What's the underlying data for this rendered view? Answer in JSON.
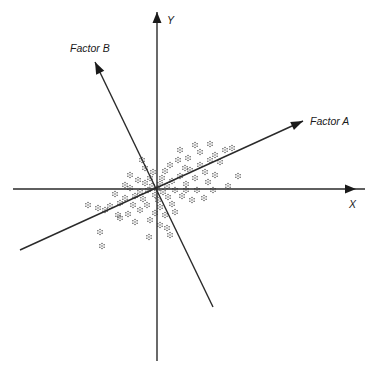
{
  "diagram": {
    "title": "",
    "axes": {
      "x": {
        "label": "X",
        "start": [
          13,
          189
        ],
        "end": [
          365,
          189
        ],
        "arrow_tip": [
          356,
          189
        ],
        "label_pos": [
          349,
          199
        ]
      },
      "y": {
        "label": "Y",
        "start": [
          157,
          361
        ],
        "end": [
          157,
          12
        ],
        "arrow_tip": [
          157,
          12
        ],
        "label_pos": [
          167,
          15
        ]
      }
    },
    "factors": [
      {
        "name": "Factor A",
        "label": "Factor A",
        "start": [
          20,
          250
        ],
        "tip": [
          303,
          121
        ],
        "label_pos": [
          310,
          116
        ]
      },
      {
        "name": "Factor B",
        "label": "Factor B",
        "start": [
          213,
          307
        ],
        "tip": [
          95,
          62
        ],
        "label_pos": [
          70,
          43
        ]
      }
    ],
    "colors": {
      "line": "#2a2a2a",
      "points": "#555555",
      "text": "#1a1a1a",
      "background": "#ffffff"
    }
  },
  "chart_data": {
    "type": "scatter",
    "title": "",
    "xlabel": "X",
    "ylabel": "Y",
    "legend": [],
    "annotations": [
      "Factor A",
      "Factor B"
    ],
    "grid": false,
    "note": "Pixel coordinates of dot-cluster markers; cloud elongated along Factor A direction, centered near the origin (157,189).",
    "points": [
      [
        157,
        189
      ],
      [
        152,
        186
      ],
      [
        160,
        184
      ],
      [
        148,
        190
      ],
      [
        163,
        192
      ],
      [
        155,
        195
      ],
      [
        145,
        183
      ],
      [
        167,
        186
      ],
      [
        140,
        192
      ],
      [
        172,
        181
      ],
      [
        150,
        178
      ],
      [
        162,
        178
      ],
      [
        135,
        196
      ],
      [
        175,
        190
      ],
      [
        158,
        200
      ],
      [
        143,
        199
      ],
      [
        168,
        197
      ],
      [
        130,
        188
      ],
      [
        180,
        176
      ],
      [
        153,
        172
      ],
      [
        165,
        171
      ],
      [
        138,
        180
      ],
      [
        186,
        184
      ],
      [
        147,
        205
      ],
      [
        160,
        207
      ],
      [
        125,
        198
      ],
      [
        190,
        170
      ],
      [
        172,
        204
      ],
      [
        133,
        205
      ],
      [
        182,
        196
      ],
      [
        170,
        165
      ],
      [
        120,
        203
      ],
      [
        195,
        178
      ],
      [
        155,
        213
      ],
      [
        140,
        210
      ],
      [
        200,
        165
      ],
      [
        178,
        160
      ],
      [
        115,
        194
      ],
      [
        188,
        158
      ],
      [
        165,
        215
      ],
      [
        205,
        172
      ],
      [
        110,
        206
      ],
      [
        197,
        190
      ],
      [
        150,
        220
      ],
      [
        210,
        160
      ],
      [
        185,
        168
      ],
      [
        128,
        214
      ],
      [
        215,
        155
      ],
      [
        192,
        200
      ],
      [
        175,
        212
      ],
      [
        105,
        210
      ],
      [
        220,
        162
      ],
      [
        200,
        152
      ],
      [
        142,
        160
      ],
      [
        130,
        175
      ],
      [
        225,
        150
      ],
      [
        208,
        182
      ],
      [
        118,
        215
      ],
      [
        180,
        150
      ],
      [
        232,
        148
      ],
      [
        98,
        208
      ],
      [
        213,
        190
      ],
      [
        160,
        225
      ],
      [
        195,
        145
      ],
      [
        238,
        176
      ],
      [
        100,
        232
      ],
      [
        88,
        205
      ],
      [
        120,
        218
      ],
      [
        149,
        237
      ],
      [
        102,
        246
      ],
      [
        167,
        228
      ],
      [
        210,
        144
      ],
      [
        228,
        186
      ],
      [
        145,
        168
      ],
      [
        186,
        190
      ],
      [
        204,
        198
      ],
      [
        135,
        222
      ],
      [
        170,
        235
      ],
      [
        215,
        175
      ],
      [
        125,
        185
      ]
    ]
  }
}
